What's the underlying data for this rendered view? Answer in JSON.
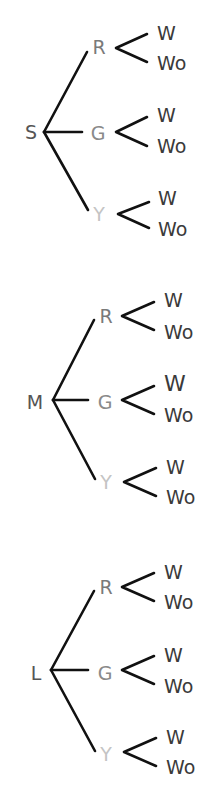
{
  "colors": {
    "line": "#111111",
    "root_label": "#555555",
    "R": "#7a7a7a",
    "G": "#8a8a8a",
    "Y": "#c4c4c4",
    "leaf": "#3a3a3a"
  },
  "trees": [
    {
      "root": "S",
      "branches": [
        {
          "label": "R",
          "leaves": [
            "W",
            "Wo"
          ]
        },
        {
          "label": "G",
          "leaves": [
            "W",
            "Wo"
          ]
        },
        {
          "label": "Y",
          "leaves": [
            "W",
            "Wo"
          ]
        }
      ]
    },
    {
      "root": "M",
      "branches": [
        {
          "label": "R",
          "leaves": [
            "W",
            "Wo"
          ]
        },
        {
          "label": "G",
          "leaves": [
            "W",
            "Wo"
          ]
        },
        {
          "label": "Y",
          "leaves": [
            "W",
            "Wo"
          ]
        }
      ]
    },
    {
      "root": "L",
      "branches": [
        {
          "label": "R",
          "leaves": [
            "W",
            "Wo"
          ]
        },
        {
          "label": "G",
          "leaves": [
            "W",
            "Wo"
          ]
        },
        {
          "label": "Y",
          "leaves": [
            "W",
            "Wo"
          ]
        }
      ]
    }
  ]
}
